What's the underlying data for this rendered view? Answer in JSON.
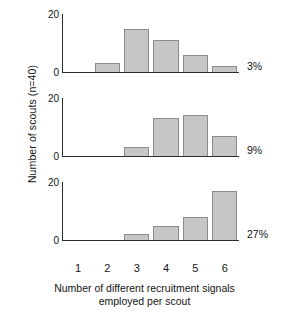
{
  "chart_data": {
    "type": "bar",
    "title": "",
    "subtitle": "",
    "xlabel_line1": "Number of different recruitment signals",
    "xlabel_line2": "employed per scout",
    "ylabel": "Number of scouts (n=40)",
    "categories": [
      "1",
      "2",
      "3",
      "4",
      "5",
      "6"
    ],
    "ylim": [
      0,
      20
    ],
    "yticks": [
      "0",
      "20"
    ],
    "grid": false,
    "legend": "none",
    "bar_color": "#c6c6c6",
    "bar_edge_color": "#8c8c8c",
    "axis_color": "#2b2b2b",
    "panels": [
      {
        "name": "panel-3-percent",
        "annotation": "3%",
        "ytick_top": "20",
        "ytick_zero": "0",
        "values": [
          0,
          3,
          15,
          11,
          6,
          2
        ]
      },
      {
        "name": "panel-9-percent",
        "annotation": "9%",
        "ytick_top": "20",
        "ytick_zero": "0",
        "values": [
          0,
          0,
          3,
          13,
          14,
          7
        ]
      },
      {
        "name": "panel-27-percent",
        "annotation": "27%",
        "ytick_top": "20",
        "ytick_zero": "0",
        "values": [
          0,
          0,
          2,
          5,
          8,
          17
        ]
      }
    ]
  }
}
